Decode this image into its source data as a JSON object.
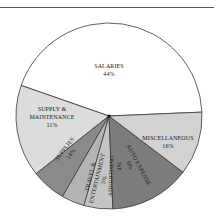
{
  "chart_data": {
    "type": "pie",
    "title": "",
    "center": [
      109,
      116
    ],
    "radius": 93,
    "slices": [
      {
        "label": "SALARIES",
        "value": 44,
        "pct_label": "44%",
        "color": "#ffffff"
      },
      {
        "label": "MISCELLANEOUS",
        "value": 16,
        "pct_label": "16%",
        "color": "#dcdcdc"
      },
      {
        "label": "AUTO EXPENSE",
        "value": 6,
        "pct_label": "6%",
        "color": "#8a8a8a"
      },
      {
        "label": "ADVERTISING",
        "value": 4,
        "pct_label": "4%",
        "color": "#b4b4b4"
      },
      {
        "label": "TRAVEL & ENTERTAINMENT",
        "value": 5,
        "pct_label": "5%",
        "color": "#c4c4c4"
      },
      {
        "label": "SUPPLIES",
        "value": 14,
        "pct_label": "14%",
        "color": "#7c7c7c"
      },
      {
        "label": "SUPPLY & MAINTENANCE",
        "value": 11,
        "pct_label": "11%",
        "color": "#d2d2d2"
      }
    ],
    "start_angle_deg": -2.4,
    "direction": "clockwise"
  },
  "labels": {
    "salaries": {
      "name": "SALARIES",
      "pct": "44%"
    },
    "misc": {
      "name": "MISCELLANEOUS",
      "pct": "16%"
    },
    "auto": {
      "name": "AUTO EXPENSE",
      "pct": "6%"
    },
    "advertising": {
      "name": "ADVERTISING",
      "pct": "4%"
    },
    "travel": {
      "name1": "TRAVEL &",
      "name2": "ENTERTAINMENT",
      "pct": "5%"
    },
    "supplies": {
      "name": "SUPPLIES",
      "pct": "14%"
    },
    "supply_maint": {
      "name1": "SUPPLY &",
      "name2": "MAINTENANCE",
      "pct": "11%"
    }
  }
}
